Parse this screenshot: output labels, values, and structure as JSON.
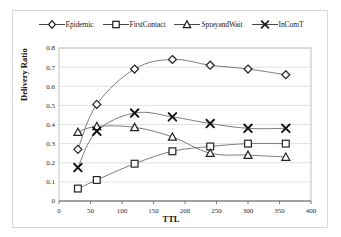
{
  "chart_data": {
    "type": "line",
    "title": "",
    "xlabel": "TTL",
    "ylabel": "Delivery Ratio",
    "x": [
      30,
      60,
      120,
      180,
      240,
      300,
      360
    ],
    "xlim": [
      0,
      400
    ],
    "ylim": [
      0,
      0.8
    ],
    "xticks": [
      "0",
      "50",
      "100",
      "150",
      "200",
      "250",
      "300",
      "350",
      "400"
    ],
    "xtick_values": [
      0,
      50,
      100,
      150,
      200,
      250,
      300,
      350,
      400
    ],
    "yticks": [
      "0",
      "0.1",
      "0.2",
      "0.3",
      "0.4",
      "0.5",
      "0.6",
      "0.7",
      "0.8"
    ],
    "ytick_values": [
      0,
      0.1,
      0.2,
      0.3,
      0.4,
      0.5,
      0.6,
      0.7,
      0.8
    ],
    "grid": "horizontal",
    "legend_position": "top-center",
    "series": [
      {
        "name": "Epidemic",
        "marker": "diamond",
        "color": "#404040",
        "values": [
          0.27,
          0.505,
          0.69,
          0.74,
          0.71,
          0.69,
          0.66
        ]
      },
      {
        "name": "FirstContact",
        "marker": "square",
        "color": "#404040",
        "values": [
          0.065,
          0.11,
          0.195,
          0.26,
          0.285,
          0.3,
          0.3
        ]
      },
      {
        "name": "SprayandWait",
        "marker": "triangle",
        "color": "#404040",
        "values": [
          0.36,
          0.39,
          0.385,
          0.335,
          0.25,
          0.24,
          0.23
        ]
      },
      {
        "name": "InComT",
        "marker": "x",
        "color": "#1a1a1a",
        "values": [
          0.175,
          0.365,
          0.46,
          0.44,
          0.405,
          0.38,
          0.38
        ]
      }
    ]
  },
  "legend": {
    "items": [
      {
        "label": "Epidemic",
        "marker": "diamond-marker-icon"
      },
      {
        "label": "FirstContact",
        "marker": "square-marker-icon"
      },
      {
        "label": "SprayandWait",
        "marker": "triangle-marker-icon"
      },
      {
        "label": "InComT",
        "marker": "x-marker-icon"
      }
    ]
  },
  "axes": {
    "x_title": "TTL",
    "y_title": "Delivery Ratio"
  }
}
